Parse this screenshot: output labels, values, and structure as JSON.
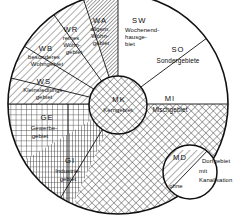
{
  "diagram": {
    "type": "circular-sector-diagram",
    "colors": {
      "stroke": "#111111",
      "background": "#ffffff",
      "hatch": "#222222"
    },
    "outer_circle": {
      "cx": 118,
      "cy": 104,
      "r": 110
    },
    "inner_circle": {
      "cx": 118,
      "cy": 105,
      "r": 29
    },
    "md_circle": {
      "cx": 190,
      "cy": 172,
      "r": 27
    }
  },
  "regions": {
    "ws": {
      "code": "WS",
      "name_line1": "Kleinsiedlungs-",
      "name_line2": "gebiet",
      "pattern": "diagonal-hatch"
    },
    "wb": {
      "code": "WB",
      "name_line1": "besonderes",
      "name_line2": "Wohngebiet",
      "pattern": "diagonal-hatch"
    },
    "wr": {
      "code": "WR",
      "name_line1": "reines",
      "name_line2": "Wohn-",
      "name_line3": "gebiet",
      "pattern": "diagonal-hatch"
    },
    "wa": {
      "code": "WA",
      "name_line1": "allgem.",
      "name_line2": "Wohn-",
      "name_line3": "gebiet",
      "pattern": "diagonal-hatch-dense"
    },
    "sw": {
      "code": "SW",
      "name_line1": "Wochenend-",
      "name_line2": "hausge-",
      "name_line3": "biet",
      "pattern": "none"
    },
    "so": {
      "code": "SO",
      "name_line1": "Sondergebiete",
      "pattern": "none"
    },
    "mi": {
      "code": "MI",
      "name_line1": "Mischgebiet",
      "pattern": "diamond-hatch"
    },
    "mk": {
      "code": "MK",
      "name_line1": "Kerngebiet",
      "pattern": "diamond-hatch"
    },
    "md": {
      "code": "MD",
      "name_line1": "Dorfgebiet",
      "name_line2": "mit",
      "name_line3": "Kanalisation",
      "name_line4": "ohne",
      "pattern": "diagonal-hatch"
    },
    "ge": {
      "code": "GE",
      "name_line1": "Gewerbe-",
      "name_line2": "gebiet",
      "pattern": "grid-fine"
    },
    "gi": {
      "code": "GI",
      "name_line1": "Industrie-",
      "name_line2": "gebiet",
      "pattern": "grid-dense"
    }
  }
}
